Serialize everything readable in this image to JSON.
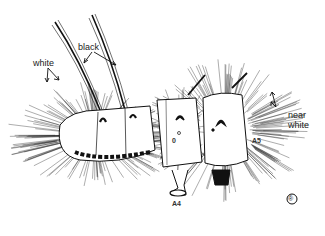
{
  "figure": {
    "labels": {
      "white": "white",
      "black": "black",
      "near_white_line1": "near",
      "near_white_line2": "white",
      "a4": "A4",
      "a5": "A5",
      "spiracle_left": "0",
      "spiracle_right": "0"
    },
    "copyright_mark": "®",
    "colors": {
      "ink": "#111111",
      "background": "#ffffff"
    }
  }
}
